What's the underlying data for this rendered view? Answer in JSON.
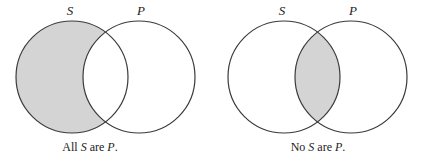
{
  "colors": {
    "shade": "#d4d4d4",
    "stroke": "#3a3a3a",
    "text": "#222222",
    "background": "#ffffff"
  },
  "diagrams": [
    {
      "name": "all-s-are-p",
      "labels": {
        "left": "S",
        "right": "P"
      },
      "shaded_region": "S outside P",
      "caption": {
        "pre": "All ",
        "subject": "S",
        "mid": " are ",
        "predicate": "P",
        "post": "."
      }
    },
    {
      "name": "no-s-are-p",
      "labels": {
        "left": "S",
        "right": "P"
      },
      "shaded_region": "S intersect P",
      "caption": {
        "pre": "No ",
        "subject": "S",
        "mid": " are ",
        "predicate": "P",
        "post": "."
      }
    }
  ]
}
